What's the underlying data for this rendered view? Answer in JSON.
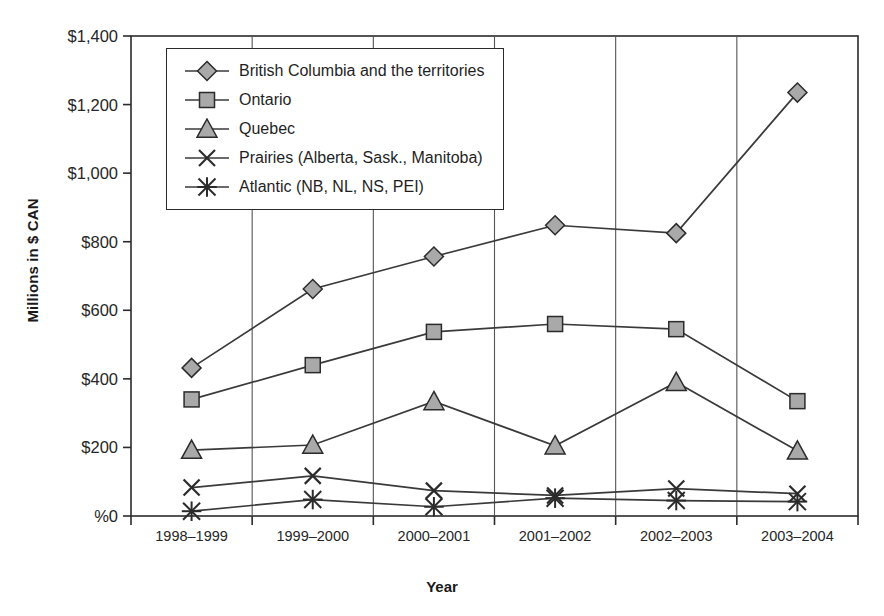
{
  "chart_data": {
    "type": "line",
    "title": "",
    "xlabel": "Year",
    "ylabel": "Millions in $ CAN",
    "categories": [
      "1998–1999",
      "1999–2000",
      "2000–2001",
      "2001–2002",
      "2002–2003",
      "2003–2004"
    ],
    "ylim": [
      0,
      1400
    ],
    "ytick_values": [
      0,
      200,
      400,
      600,
      800,
      1000,
      1200,
      1400
    ],
    "ytick_labels": [
      "%0",
      "$200",
      "$400",
      "$600",
      "$800",
      "$1,000",
      "$1,200",
      "$1,400"
    ],
    "grid": "vertical",
    "legend_position": "top-left-inside",
    "series": [
      {
        "name": "British Columbia and the territories",
        "marker": "diamond",
        "values": [
          432,
          662,
          757,
          848,
          825,
          1235
        ]
      },
      {
        "name": "Ontario",
        "marker": "square",
        "values": [
          340,
          440,
          537,
          560,
          545,
          335
        ]
      },
      {
        "name": "Quebec",
        "marker": "triangle",
        "values": [
          192,
          207,
          334,
          205,
          390,
          190
        ]
      },
      {
        "name": "Prairies (Alberta, Sask., Manitoba)",
        "marker": "cross",
        "values": [
          83,
          117,
          74,
          60,
          80,
          65
        ]
      },
      {
        "name": "Atlantic (NB, NL, NS, PEI)",
        "marker": "asterisk",
        "values": [
          14,
          48,
          27,
          52,
          45,
          42
        ]
      }
    ],
    "colors": {
      "line": "#3a3a3a",
      "marker_fill": "#a9a9a9",
      "marker_stroke": "#2b2b2b",
      "axis": "#2b2b2b",
      "gridline": "#555555",
      "background": "#ffffff"
    }
  },
  "legend": {
    "items": [
      {
        "label": "British Columbia and the territories",
        "marker": "diamond-marker-icon"
      },
      {
        "label": "Ontario",
        "marker": "square-marker-icon"
      },
      {
        "label": "Quebec",
        "marker": "triangle-marker-icon"
      },
      {
        "label": "Prairies (Alberta, Sask., Manitoba)",
        "marker": "cross-marker-icon"
      },
      {
        "label": "Atlantic (NB, NL, NS, PEI)",
        "marker": "asterisk-marker-icon"
      }
    ]
  }
}
